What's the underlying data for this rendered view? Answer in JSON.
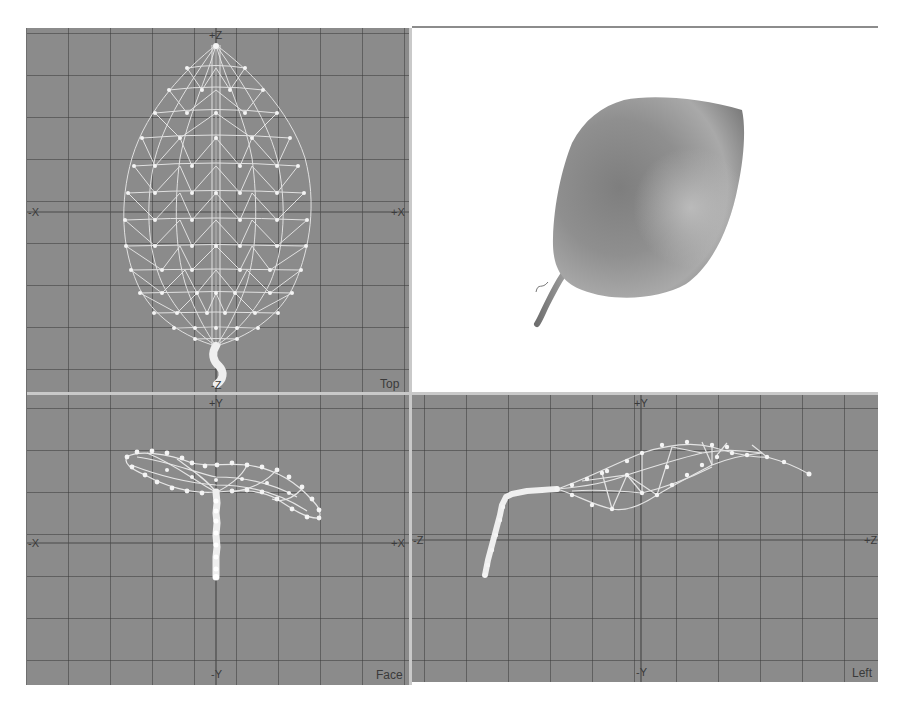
{
  "app": {
    "layout": "four-viewport 3D modeler"
  },
  "viewports": {
    "top": {
      "name": "Top",
      "axes": {
        "top": "+Z",
        "bottom": "-Z",
        "left": "-X",
        "right": "+X"
      },
      "mode": "wireframe"
    },
    "perspective": {
      "name": "",
      "mode": "shaded",
      "background": "#ffffff"
    },
    "face": {
      "name": "Face",
      "axes": {
        "top": "+Y",
        "bottom": "-Y",
        "left": "-X",
        "right": "+X"
      },
      "mode": "wireframe"
    },
    "left": {
      "name": "Left",
      "axes": {
        "top": "+Y",
        "bottom": "-Y",
        "left": "-Z",
        "right": "+Z"
      },
      "mode": "wireframe"
    }
  },
  "object": {
    "label": "leaf mesh"
  },
  "colors": {
    "viewport_bg": "#8b8b8b",
    "grid_line": "#5a5a5a",
    "axis_line": "#4a4a4a",
    "wire": "#e8e8e8",
    "vertex": "#f4f4f4",
    "divider": "#c9c9c9",
    "shaded_leaf": "#8e8e8e"
  }
}
